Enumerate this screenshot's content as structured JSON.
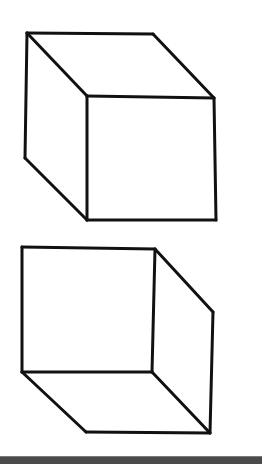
{
  "figure": {
    "stroke_color": "#111111",
    "background_color": "#ffffff",
    "stroke_width": 3
  },
  "cubes": [
    {
      "name": "top-cube",
      "view": "viewed from above-left",
      "edges": [
        [
          [
            27,
            33
          ],
          [
            153,
            34
          ]
        ],
        [
          [
            153,
            34
          ],
          [
            214,
            98
          ]
        ],
        [
          [
            27,
            33
          ],
          [
            87,
            96
          ]
        ],
        [
          [
            87,
            96
          ],
          [
            214,
            98
          ]
        ],
        [
          [
            27,
            33
          ],
          [
            25,
            158
          ]
        ],
        [
          [
            25,
            158
          ],
          [
            87,
            220
          ]
        ],
        [
          [
            87,
            96
          ],
          [
            87,
            220
          ]
        ],
        [
          [
            87,
            220
          ],
          [
            216,
            220
          ]
        ],
        [
          [
            214,
            98
          ],
          [
            216,
            220
          ]
        ]
      ]
    },
    {
      "name": "bottom-cube",
      "view": "viewed from below-right",
      "edges": [
        [
          [
            22,
            247
          ],
          [
            155,
            249
          ]
        ],
        [
          [
            22,
            247
          ],
          [
            22,
            372
          ]
        ],
        [
          [
            155,
            249
          ],
          [
            152,
            372
          ]
        ],
        [
          [
            22,
            372
          ],
          [
            152,
            372
          ]
        ],
        [
          [
            155,
            249
          ],
          [
            213,
            312
          ]
        ],
        [
          [
            213,
            312
          ],
          [
            210,
            433
          ]
        ],
        [
          [
            22,
            372
          ],
          [
            86,
            432
          ]
        ],
        [
          [
            152,
            372
          ],
          [
            210,
            433
          ]
        ],
        [
          [
            86,
            432
          ],
          [
            210,
            433
          ]
        ]
      ]
    }
  ],
  "bottom_bar": {
    "color": "#4a4a4a"
  }
}
